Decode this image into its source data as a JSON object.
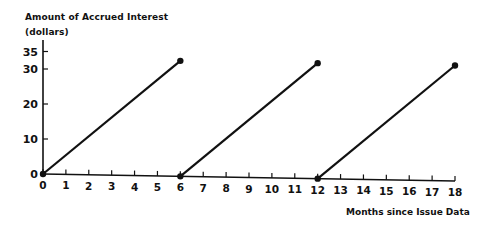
{
  "chart_data": {
    "type": "line",
    "title": "",
    "ylabel_line1": "Amount of Accrued Interest",
    "ylabel_line2": "(dollars)",
    "xlabel": "Months since Issue Data",
    "xlim": [
      0,
      18
    ],
    "ylim": [
      0,
      35
    ],
    "x_ticks": [
      0,
      1,
      2,
      3,
      4,
      5,
      6,
      7,
      8,
      9,
      10,
      11,
      12,
      13,
      14,
      15,
      16,
      17,
      18
    ],
    "y_ticks": [
      0,
      10,
      20,
      30,
      35
    ],
    "grid": false,
    "legend": null,
    "series": [
      {
        "name": "Period 1",
        "x": [
          0,
          6
        ],
        "y": [
          0,
          33
        ]
      },
      {
        "name": "Period 2",
        "x": [
          6,
          12
        ],
        "y": [
          0,
          33
        ]
      },
      {
        "name": "Period 3",
        "x": [
          12,
          18
        ],
        "y": [
          0,
          33
        ]
      }
    ],
    "markers": "filled-circle at segment endpoints",
    "line_color": "#111111"
  }
}
